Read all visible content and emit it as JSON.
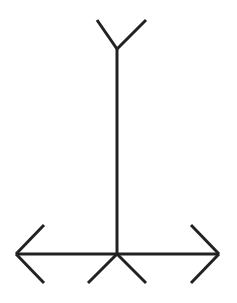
{
  "figure": {
    "stroke_color": "#222222",
    "background": "#ffffff",
    "stroke_width": 3
  },
  "segments": {
    "vertical": {
      "x1": 117,
      "y1": 49,
      "x2": 117,
      "y2": 254
    },
    "top_left_fin": {
      "x1": 97,
      "y1": 20,
      "x2": 117,
      "y2": 49
    },
    "top_right_fin": {
      "x1": 146,
      "y1": 20,
      "x2": 117,
      "y2": 49
    },
    "horizontal": {
      "x1": 16,
      "y1": 254,
      "x2": 219,
      "y2": 254
    },
    "left_arrow_upper": {
      "x1": 44,
      "y1": 225,
      "x2": 16,
      "y2": 254
    },
    "left_arrow_lower": {
      "x1": 44,
      "y1": 283,
      "x2": 16,
      "y2": 254
    },
    "right_arrow_upper": {
      "x1": 191,
      "y1": 225,
      "x2": 219,
      "y2": 254
    },
    "right_arrow_lower": {
      "x1": 191,
      "y1": 283,
      "x2": 219,
      "y2": 254
    },
    "bottom_left_fin": {
      "x1": 117,
      "y1": 254,
      "x2": 88,
      "y2": 283
    },
    "bottom_right_fin": {
      "x1": 117,
      "y1": 254,
      "x2": 146,
      "y2": 283
    }
  }
}
